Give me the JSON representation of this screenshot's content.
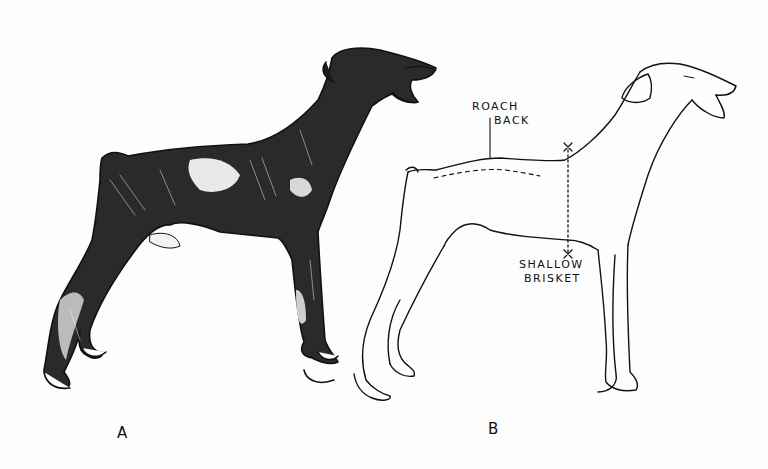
{
  "figure": {
    "type": "comparison-illustration",
    "panels": [
      {
        "id": "A",
        "label": "A",
        "style": "shaded ink drawing, standing dog facing right"
      },
      {
        "id": "B",
        "label": "B",
        "style": "outline drawing, standing dog facing right, with faults annotated"
      }
    ],
    "annotations": [
      {
        "line1": "ROACH",
        "line2": "BACK",
        "target": "topline arched over loin (dashed curve)"
      },
      {
        "line1": "SHALLOW",
        "line2": "BRISKET",
        "target": "chest depth marked by dotted vertical between two x marks"
      }
    ],
    "colors": {
      "ink": "#111111",
      "paper": "#fdfdfd"
    }
  }
}
